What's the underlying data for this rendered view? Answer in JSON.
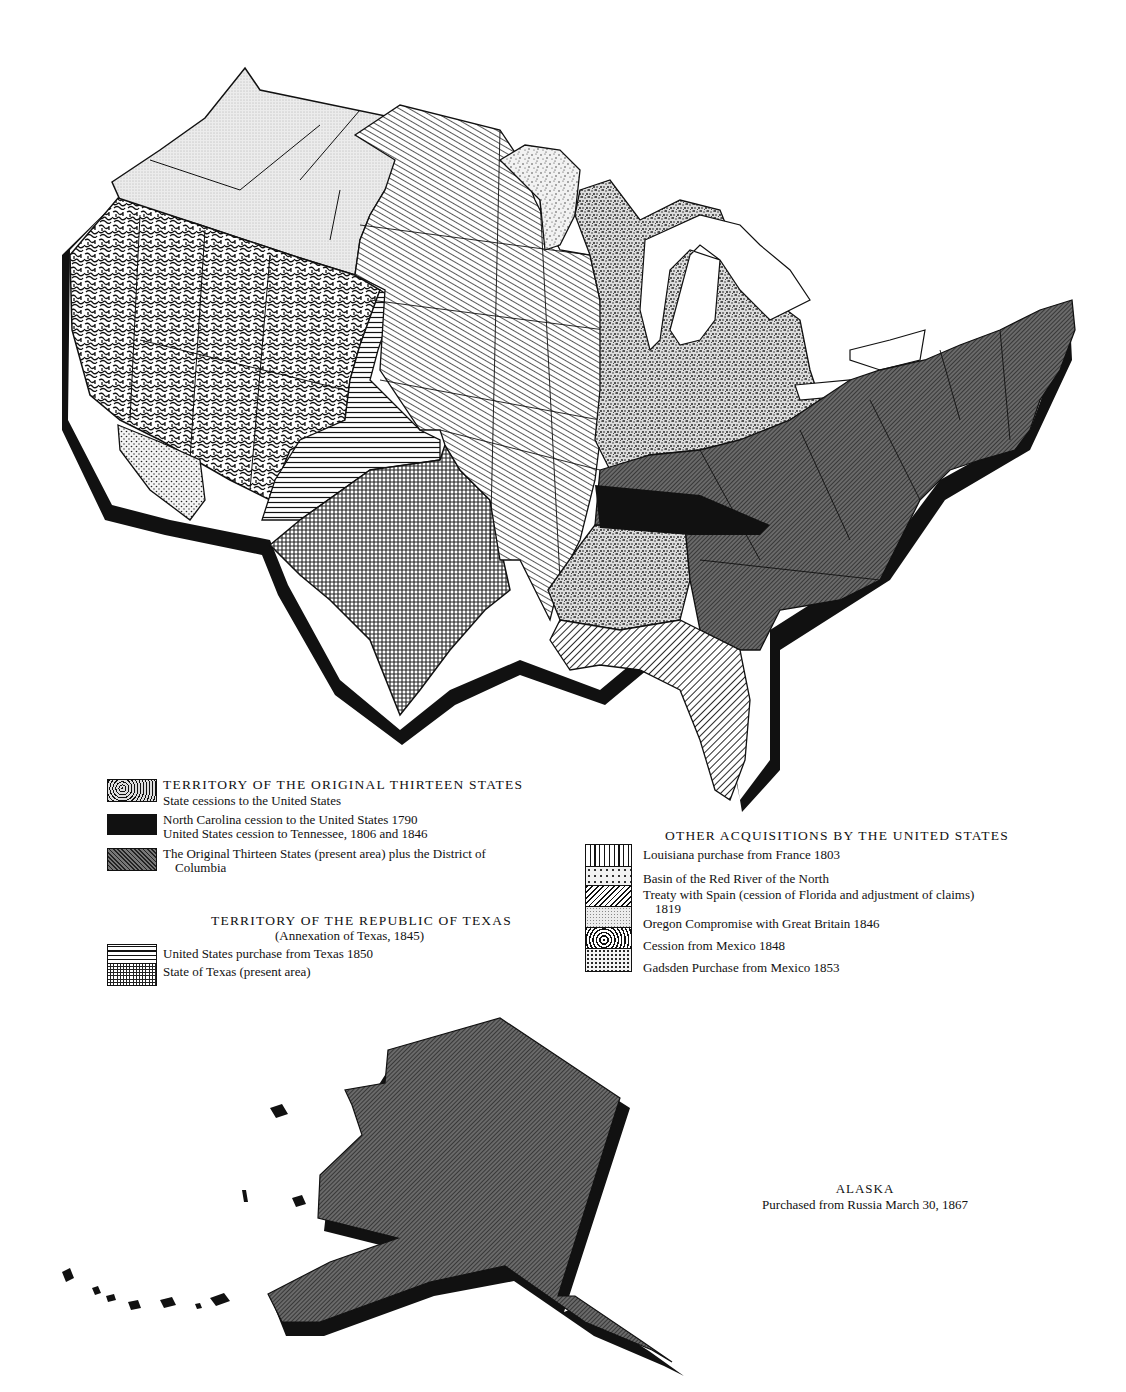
{
  "map": {
    "title": "Territorial Acquisitions of the United States",
    "regions": [
      {
        "id": "oregon",
        "legend_key": "oregon_compromise",
        "pattern": "fine-dots-light"
      },
      {
        "id": "mexican-cession",
        "legend_key": "cession_mexico",
        "pattern": "worm"
      },
      {
        "id": "gadsden",
        "legend_key": "gadsden",
        "pattern": "dots"
      },
      {
        "id": "louisiana",
        "legend_key": "louisiana",
        "pattern": "diag-fine"
      },
      {
        "id": "red-river",
        "legend_key": "red_river",
        "pattern": "speckle"
      },
      {
        "id": "texas-purchase-1850",
        "legend_key": "texas_purchase",
        "pattern": "horizontal"
      },
      {
        "id": "texas",
        "legend_key": "texas_state",
        "pattern": "grid"
      },
      {
        "id": "state-cessions",
        "legend_key": "state_cessions",
        "pattern": "speckle-dense"
      },
      {
        "id": "tennessee-cession",
        "legend_key": "nc_cession",
        "pattern": "solid-black"
      },
      {
        "id": "original-thirteen",
        "legend_key": "original_thirteen",
        "pattern": "diag-dark"
      },
      {
        "id": "florida-spain",
        "legend_key": "treaty_spain",
        "pattern": "diag-wide"
      },
      {
        "id": "alaska",
        "legend_key": "alaska",
        "pattern": "diag-dark"
      }
    ]
  },
  "legend_original": {
    "heading": "TERRITORY OF THE ORIGINAL THIRTEEN STATES",
    "items": [
      {
        "key": "state_cessions",
        "lines": [
          "State cessions to the United States"
        ]
      },
      {
        "key": "nc_cession",
        "lines": [
          "North Carolina cession to the United States 1790",
          "United States cession to Tennessee, 1806 and 1846"
        ]
      },
      {
        "key": "original_thirteen",
        "lines": [
          "The Original Thirteen States (present area) plus the District of",
          "Columbia"
        ]
      }
    ]
  },
  "legend_texas": {
    "heading": "TERRITORY OF THE REPUBLIC OF TEXAS",
    "subheading": "(Annexation of Texas, 1845)",
    "items": [
      {
        "key": "texas_purchase",
        "lines": [
          "United States purchase from Texas 1850"
        ]
      },
      {
        "key": "texas_state",
        "lines": [
          "State of Texas (present area)"
        ]
      }
    ]
  },
  "legend_other": {
    "heading": "OTHER ACQUISITIONS BY THE UNITED STATES",
    "items": [
      {
        "key": "louisiana",
        "lines": [
          "Louisiana purchase from France 1803"
        ]
      },
      {
        "key": "red_river",
        "lines": [
          "Basin of the Red River of the North"
        ]
      },
      {
        "key": "treaty_spain",
        "lines": [
          "Treaty with Spain (cession of Florida and adjustment of claims)",
          "1819"
        ]
      },
      {
        "key": "oregon_compromise",
        "lines": [
          "Oregon Compromise with Great Britain 1846"
        ]
      },
      {
        "key": "cession_mexico",
        "lines": [
          "Cession from Mexico 1848"
        ]
      },
      {
        "key": "gadsden",
        "lines": [
          "Gadsden Purchase from Mexico 1853"
        ]
      }
    ]
  },
  "alaska": {
    "title": "ALASKA",
    "subtitle": "Purchased from Russia March 30, 1867"
  },
  "colors": {
    "ink": "#111111",
    "paper": "#ffffff",
    "dark_fill": "#5a5a5a",
    "light_fill": "#e6e6e6"
  }
}
